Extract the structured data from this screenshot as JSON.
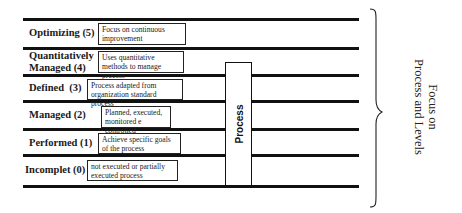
{
  "levels": [
    {
      "name": "Optimizing (5)",
      "description": "Focus on continuous improvement"
    },
    {
      "name": "Quantitatively Managed (4)",
      "name_line1": "Quantitatively",
      "name_line2": "Managed (4)",
      "description": "Uses quantitative methods to manage process"
    },
    {
      "name": "Defined  (3)",
      "description": "Process adapted from organization standard process"
    },
    {
      "name": "Managed (2)",
      "description": "Planned, executed, monitored e controlled"
    },
    {
      "name": "Performed (1)",
      "description": "Achieve specific goals of the process"
    },
    {
      "name": "Incomplet (0)",
      "description": "not executed or partially executed process"
    }
  ],
  "process_label": "Process",
  "side_label": {
    "line1": "Focus on",
    "line2": "Process and Levels"
  },
  "colors": {
    "line": "#111111",
    "background": "#ffffff"
  }
}
